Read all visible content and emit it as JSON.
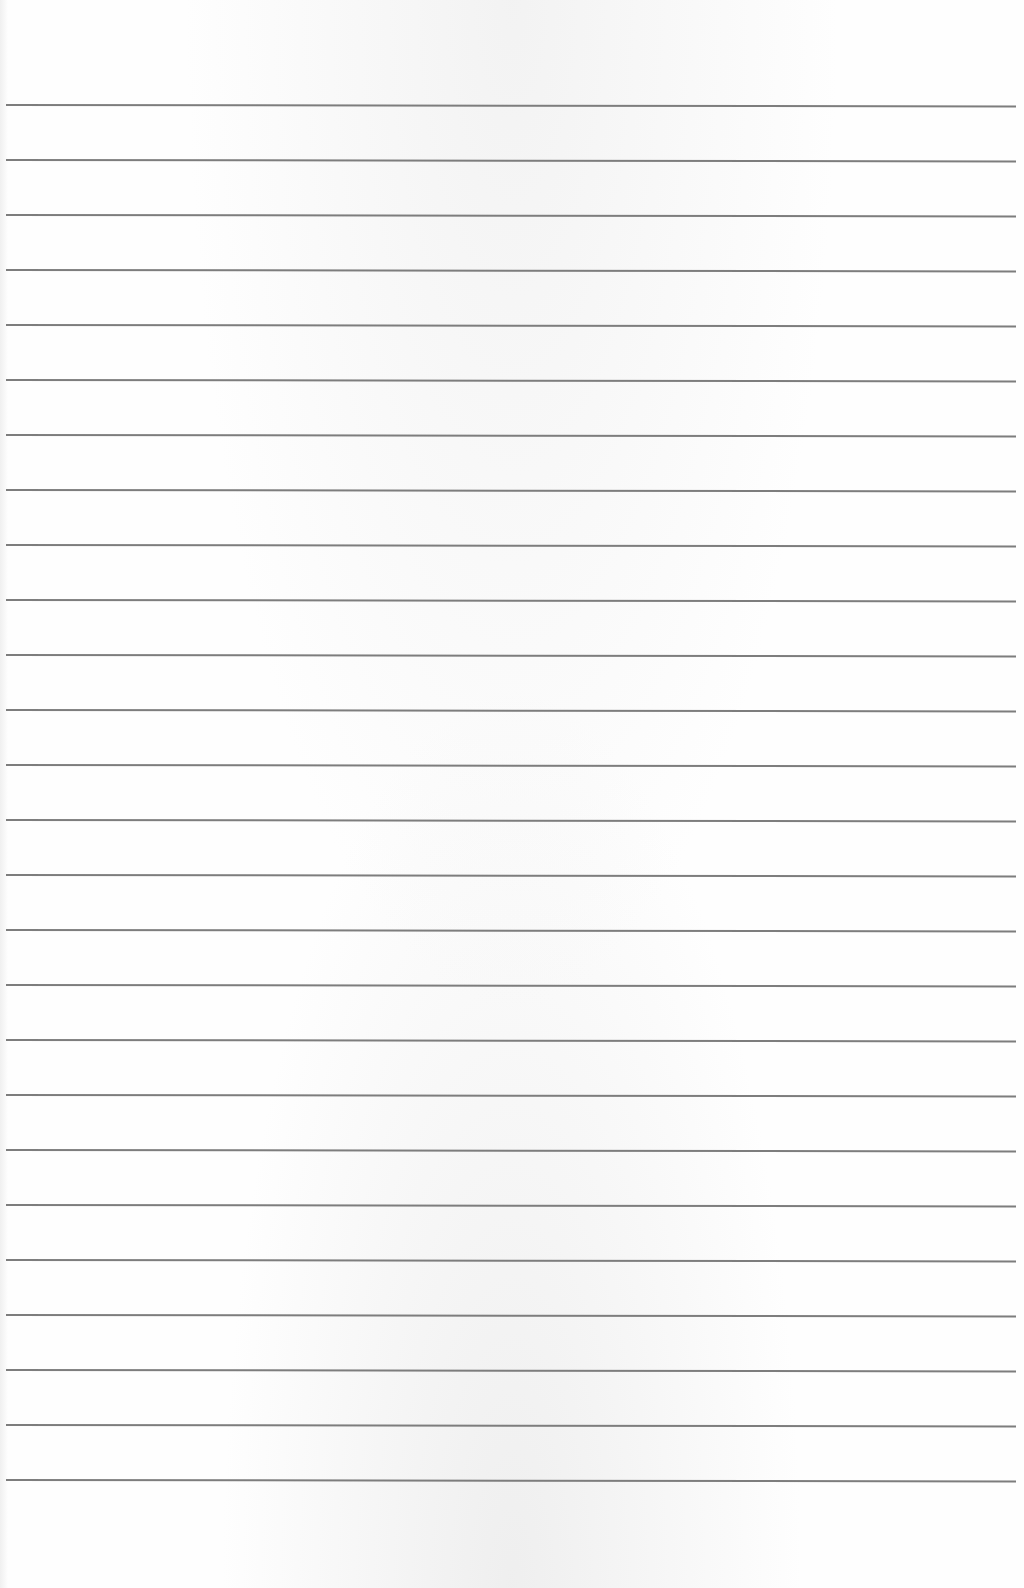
{
  "sheet": {
    "type": "lined-paper",
    "background_color": "#fefefe",
    "line_color": "#7d7d7d",
    "line_count": 26,
    "first_line_y": 104,
    "line_spacing": 55,
    "line_left_x": 6,
    "line_right_x": 1016,
    "text": []
  }
}
